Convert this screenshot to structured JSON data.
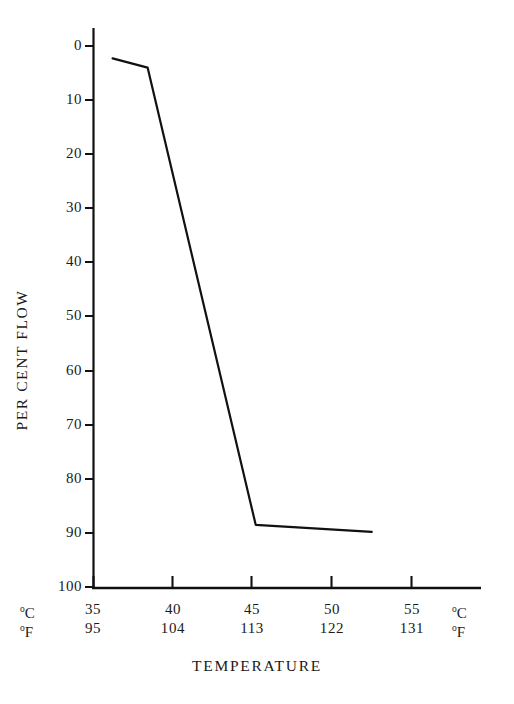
{
  "chart_data": {
    "type": "line",
    "title": "",
    "xlabel": "TEMPERATURE",
    "ylabel": "PER CENT FLOW",
    "grid": false,
    "legend": "none",
    "y_inverted": true,
    "ylim": [
      0,
      100
    ],
    "yticks": [
      0,
      10,
      20,
      30,
      40,
      50,
      60,
      70,
      80,
      90,
      100
    ],
    "ytick_labels": [
      "0",
      "10",
      "20",
      "30",
      "40",
      "50",
      "60",
      "70",
      "80",
      "90",
      "100"
    ],
    "x_axis_primary": {
      "unit_label": "°C",
      "unit_left": "C",
      "unit_right": "C",
      "ticks": [
        35,
        40,
        45,
        50,
        55
      ],
      "tick_labels": [
        "35",
        "40",
        "45",
        "50",
        "55"
      ]
    },
    "x_axis_secondary": {
      "unit_label": "°F",
      "unit_left": "F",
      "unit_right": "F",
      "ticks": [
        95,
        104,
        113,
        122,
        131
      ],
      "tick_labels": [
        "95",
        "104",
        "113",
        "122",
        "131"
      ]
    },
    "xlim_celsius": [
      35,
      60
    ],
    "series": [
      {
        "name": "per cent flow",
        "x": [
          36.2,
          38.4,
          45.2,
          52.5
        ],
        "y": [
          2.3,
          4.0,
          88.5,
          89.8
        ],
        "x_unit": "°C",
        "y_unit": "per cent"
      }
    ],
    "line_color": "#111111",
    "line_width_px": 2.2
  },
  "axis": {
    "y_title": "PER CENT FLOW",
    "x_title": "TEMPERATURE"
  }
}
